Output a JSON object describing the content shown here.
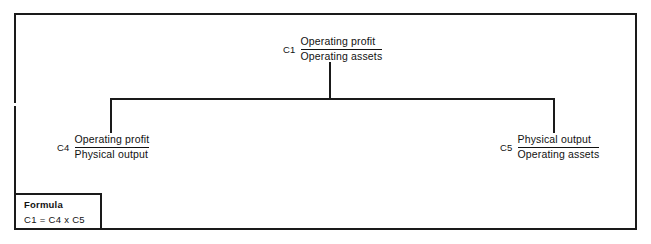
{
  "diagram": {
    "type": "hierarchy-tree",
    "frame": {
      "visible": true
    },
    "nodes": [
      {
        "id": "c1",
        "code": "C1",
        "numerator": "Operating profit",
        "denominator": "Operating assets",
        "level": "root"
      },
      {
        "id": "c4",
        "code": "C4",
        "numerator": "Operating profit",
        "denominator": "Physical output",
        "level": "child"
      },
      {
        "id": "c5",
        "code": "C5",
        "numerator": "Physical output",
        "denominator": "Operating assets",
        "level": "child"
      }
    ],
    "edges": [
      {
        "from": "c1",
        "to": "c4"
      },
      {
        "from": "c1",
        "to": "c5"
      }
    ]
  },
  "formula": {
    "title": "Formula",
    "expression": "C1 = C4 x C5"
  },
  "colors": {
    "ink": "#1a1a1a",
    "text": "#111111",
    "background": "#ffffff"
  }
}
